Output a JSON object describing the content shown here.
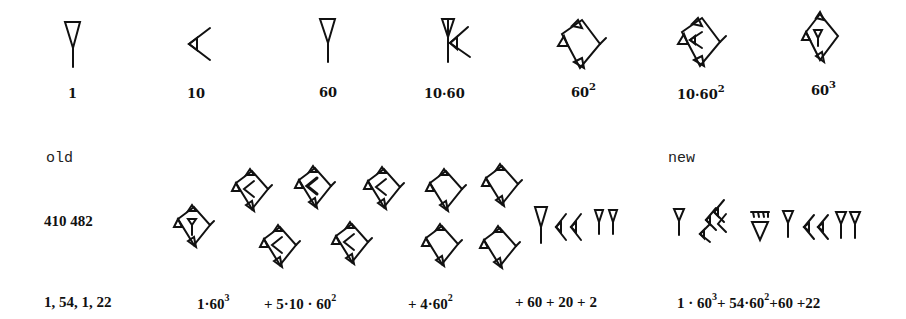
{
  "legend": {
    "items": [
      {
        "label": "1",
        "symbol": "wedge-vertical"
      },
      {
        "label": "10",
        "symbol": "corner-wedge"
      },
      {
        "label": "60",
        "symbol": "wedge-vertical"
      },
      {
        "label": "10·60",
        "symbol": "wedge-with-corner"
      },
      {
        "label": "60",
        "sup": "2",
        "symbol": "sar"
      },
      {
        "label": "10·60",
        "sup": "2",
        "symbol": "sar-with-corner"
      },
      {
        "label": "60",
        "sup": "3",
        "symbol": "sar-with-wedge"
      }
    ]
  },
  "example": {
    "old_label": "old",
    "new_label": "new",
    "decimal_value": "410 482",
    "sexagesimal": "1, 54, 1, 22",
    "old_terms": {
      "t1": "1·60",
      "t1_sup": "3",
      "t2": "+ 5·10 · 60",
      "t2_sup": "2",
      "t3": "+ 4·60",
      "t3_sup": "2",
      "t4": "+ 60 + 20 + 2"
    },
    "new_expression": {
      "a": "1 · 60",
      "a_sup": "3",
      "b": "+ 54·60",
      "b_sup": "2",
      "c": "+60 +22"
    }
  }
}
